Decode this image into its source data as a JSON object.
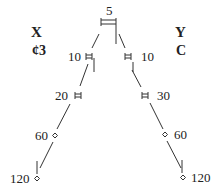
{
  "diagram": {
    "left_header": {
      "letter": "X",
      "symbol": "¢3"
    },
    "right_header": {
      "letter": "Y",
      "symbol": "C"
    },
    "root": {
      "label": "5",
      "glyph": "double-bar"
    },
    "left_branch": [
      {
        "label": "10",
        "glyph": "double-bar"
      },
      {
        "label": "20",
        "glyph": "double-bar"
      },
      {
        "label": "60",
        "glyph": "diamond"
      },
      {
        "label": "120",
        "glyph": "diamond"
      }
    ],
    "right_branch": [
      {
        "label": "10",
        "glyph": "double-bar"
      },
      {
        "label": "30",
        "glyph": "double-bar"
      },
      {
        "label": "60",
        "glyph": "diamond"
      },
      {
        "label": "120",
        "glyph": "diamond"
      }
    ],
    "line_color": "#333333"
  }
}
